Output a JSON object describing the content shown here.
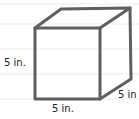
{
  "figure": {
    "shape": "cube",
    "labels": {
      "height": "5 in.",
      "width": "5 in.",
      "depth": "5 in"
    },
    "colors": {
      "edge": "#5f5f5f",
      "ruled_line": "#e6e6e6",
      "text": "#222222",
      "background": "#ffffff"
    }
  }
}
